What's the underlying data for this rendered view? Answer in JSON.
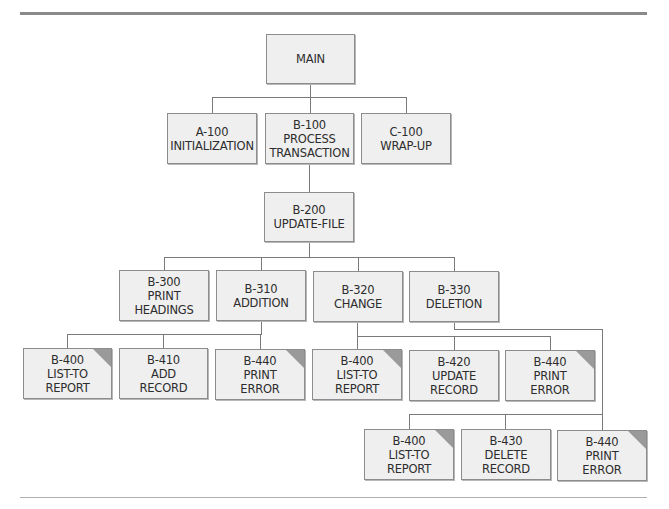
{
  "diagram": {
    "type": "hierarchy-chart",
    "nodes": [
      {
        "id": "main",
        "lines": [
          "MAIN"
        ],
        "x": 266,
        "y": 34,
        "w": 89,
        "h": 50,
        "corner": false
      },
      {
        "id": "a100",
        "lines": [
          "A-100",
          "INITIALIZATION"
        ],
        "x": 167,
        "y": 113,
        "w": 90,
        "h": 51,
        "corner": false
      },
      {
        "id": "b100",
        "lines": [
          "B-100",
          "PROCESS",
          "TRANSACTION"
        ],
        "x": 265,
        "y": 113,
        "w": 89,
        "h": 51,
        "corner": false
      },
      {
        "id": "c100",
        "lines": [
          "C-100",
          "WRAP-UP"
        ],
        "x": 361,
        "y": 113,
        "w": 90,
        "h": 51,
        "corner": false
      },
      {
        "id": "b200",
        "lines": [
          "B-200",
          "UPDATE-FILE"
        ],
        "x": 264,
        "y": 192,
        "w": 90,
        "h": 50,
        "corner": false
      },
      {
        "id": "b300",
        "lines": [
          "B-300",
          "PRINT",
          "HEADINGS"
        ],
        "x": 119,
        "y": 270,
        "w": 90,
        "h": 51,
        "corner": false
      },
      {
        "id": "b310",
        "lines": [
          "B-310",
          "ADDITION"
        ],
        "x": 216,
        "y": 270,
        "w": 90,
        "h": 51,
        "corner": false
      },
      {
        "id": "b320",
        "lines": [
          "B-320",
          "CHANGE"
        ],
        "x": 313,
        "y": 271,
        "w": 90,
        "h": 51,
        "corner": false
      },
      {
        "id": "b330",
        "lines": [
          "B-330",
          "DELETION"
        ],
        "x": 409,
        "y": 271,
        "w": 90,
        "h": 51,
        "corner": false
      },
      {
        "id": "b400a",
        "lines": [
          "B-400",
          "LIST-TO",
          "REPORT"
        ],
        "x": 23,
        "y": 348,
        "w": 89,
        "h": 51,
        "corner": true
      },
      {
        "id": "b410",
        "lines": [
          "B-410",
          "ADD",
          "RECORD"
        ],
        "x": 119,
        "y": 348,
        "w": 89,
        "h": 51,
        "corner": false
      },
      {
        "id": "b440a",
        "lines": [
          "B-440",
          "PRINT",
          "ERROR"
        ],
        "x": 215,
        "y": 349,
        "w": 90,
        "h": 51,
        "corner": true
      },
      {
        "id": "b400b",
        "lines": [
          "B-400",
          "LIST-TO",
          "REPORT"
        ],
        "x": 312,
        "y": 349,
        "w": 90,
        "h": 51,
        "corner": true
      },
      {
        "id": "b420",
        "lines": [
          "B-420",
          "UPDATE",
          "RECORD"
        ],
        "x": 409,
        "y": 350,
        "w": 90,
        "h": 51,
        "corner": false
      },
      {
        "id": "b440b",
        "lines": [
          "B-440",
          "PRINT",
          "ERROR"
        ],
        "x": 505,
        "y": 350,
        "w": 90,
        "h": 51,
        "corner": true
      },
      {
        "id": "b400c",
        "lines": [
          "B-400",
          "LIST-TO",
          "REPORT"
        ],
        "x": 364,
        "y": 429,
        "w": 90,
        "h": 51,
        "corner": true
      },
      {
        "id": "b430",
        "lines": [
          "B-430",
          "DELETE",
          "RECORD"
        ],
        "x": 461,
        "y": 429,
        "w": 90,
        "h": 51,
        "corner": false
      },
      {
        "id": "b440c",
        "lines": [
          "B-440",
          "PRINT",
          "ERROR"
        ],
        "x": 557,
        "y": 430,
        "w": 90,
        "h": 51,
        "corner": true
      }
    ],
    "edges": [
      [
        "main",
        "a100"
      ],
      [
        "main",
        "b100"
      ],
      [
        "main",
        "c100"
      ],
      [
        "b100",
        "b200"
      ],
      [
        "b200",
        "b300"
      ],
      [
        "b200",
        "b310"
      ],
      [
        "b200",
        "b320"
      ],
      [
        "b200",
        "b330"
      ],
      [
        "b310",
        "b400a"
      ],
      [
        "b310",
        "b410"
      ],
      [
        "b310",
        "b440a"
      ],
      [
        "b320",
        "b400b"
      ],
      [
        "b320",
        "b420"
      ],
      [
        "b320",
        "b440b"
      ],
      [
        "b330",
        "b400c"
      ],
      [
        "b330",
        "b430"
      ],
      [
        "b330",
        "b440c"
      ]
    ],
    "legend_note": "Shaded corner marks a module that appears more than once in the chart",
    "colors": {
      "box_fill": "#efefef",
      "box_border": "#8c8c8c",
      "corner_fill": "#9a9a9a",
      "connector": "#7a7a7a",
      "text": "#2d2d2d",
      "rule_top": "#8a8a8a",
      "rule_bottom": "#b0b0b0"
    }
  }
}
